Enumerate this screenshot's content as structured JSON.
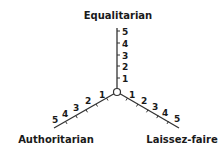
{
  "diagram": {
    "type": "tri-axis",
    "center": {
      "x": 117,
      "y": 92,
      "radius": 3.5
    },
    "axes": [
      {
        "name": "Equalitarian",
        "direction": "up",
        "ticks": [
          "1",
          "2",
          "3",
          "4",
          "5"
        ]
      },
      {
        "name": "Authoritarian",
        "direction": "down-left",
        "ticks": [
          "1",
          "2",
          "3",
          "4",
          "5"
        ]
      },
      {
        "name": "Laissez-faire",
        "direction": "down-right",
        "ticks": [
          "1",
          "2",
          "3",
          "4",
          "5"
        ]
      }
    ],
    "colors": {
      "line": "#333333",
      "text": "#1a1a1a",
      "background": "#ffffff"
    }
  }
}
